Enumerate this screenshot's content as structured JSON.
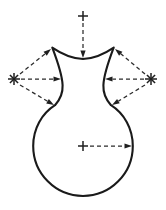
{
  "figure": {
    "canvas": {
      "width": 166,
      "height": 210
    },
    "colors": {
      "background": "#ffffff",
      "outline": "#1a1a1a",
      "dimension": "#2b2b2b",
      "center_mark": "#1f1f1f"
    },
    "outline": {
      "name": "vase-silhouette",
      "path": "M 83 59 C 73 58.6 62.5 54.6 52.3 47.6 C 57.6 61.5 62.2 74.0 62.6 85.2 C 63.0 93.5 60.2 99.4 55.0 105.2 C 41.8 113.6 33.2 128.6 33.2 146.0 C 33.2 173.6 55.5 196.0 83.0 196.0 C 110.5 196.0 132.8 173.6 132.8 146.0 C 132.8 128.6 124.2 113.6 111.0 105.2 C 105.8 99.4 103.0 93.5 103.4 85.2 C 103.8 74.0 108.4 61.5 113.7 47.6 C 103.5 54.6 93.0 58.6 83 59 Z"
    },
    "center_marks": [
      {
        "name": "top-center-mark",
        "x": 83,
        "y": 16,
        "style": "cross",
        "size": 5
      },
      {
        "name": "left-center-mark",
        "x": 14,
        "y": 79,
        "style": "asterisk",
        "size": 6
      },
      {
        "name": "right-center-mark",
        "x": 151,
        "y": 79,
        "style": "asterisk",
        "size": 6
      },
      {
        "name": "bulb-center-mark",
        "x": 83,
        "y": 146,
        "style": "cross",
        "size": 5
      }
    ],
    "dimension_arrows": [
      {
        "name": "top-radius-arrow",
        "from_x": 83,
        "from_y": 23,
        "to_x": 83,
        "to_y": 58
      },
      {
        "name": "left-upper-radius-arrow",
        "from_x": 20,
        "from_y": 74,
        "to_x": 51,
        "to_y": 49
      },
      {
        "name": "left-horizontal-radius-arrow",
        "from_x": 21,
        "from_y": 79,
        "to_x": 61,
        "to_y": 79
      },
      {
        "name": "left-lower-radius-arrow",
        "from_x": 20,
        "from_y": 85,
        "to_x": 54,
        "to_y": 105
      },
      {
        "name": "right-upper-radius-arrow",
        "from_x": 145,
        "from_y": 74,
        "to_x": 115,
        "to_y": 49
      },
      {
        "name": "right-horizontal-radius-arrow",
        "from_x": 144,
        "from_y": 79,
        "to_x": 105,
        "to_y": 79
      },
      {
        "name": "right-lower-radius-arrow",
        "from_x": 145,
        "from_y": 85,
        "to_x": 112,
        "to_y": 105
      },
      {
        "name": "bulb-radius-arrow",
        "from_x": 90,
        "from_y": 146,
        "to_x": 132,
        "to_y": 146
      }
    ]
  }
}
